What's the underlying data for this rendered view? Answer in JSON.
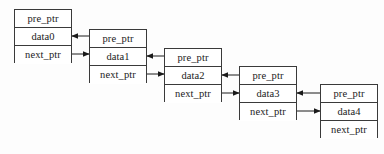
{
  "diagram": {
    "type": "doubly-linked-list",
    "background_color": "#fdfdfd",
    "border_color": "#3a3a3a",
    "text_color": "#1a1a1a",
    "node_width": 58,
    "node_height": 54,
    "cell_height": 18,
    "nodes": [
      {
        "id": "node0",
        "x": 14,
        "y": 9,
        "pre_ptr": "pre_ptr",
        "data": "data0",
        "next_ptr": "next_ptr"
      },
      {
        "id": "node1",
        "x": 89,
        "y": 29,
        "pre_ptr": "pre_ptr",
        "data": "data1",
        "next_ptr": "next_ptr"
      },
      {
        "id": "node2",
        "x": 164,
        "y": 48,
        "pre_ptr": "pre_ptr",
        "data": "data2",
        "next_ptr": "next_ptr"
      },
      {
        "id": "node3",
        "x": 239,
        "y": 66,
        "pre_ptr": "pre_ptr",
        "data": "data3",
        "next_ptr": "next_ptr"
      },
      {
        "id": "node4",
        "x": 320,
        "y": 84,
        "pre_ptr": "pre_ptr",
        "data": "data4",
        "next_ptr": "next_ptr"
      }
    ],
    "connections": [
      {
        "id": "next-0-1",
        "kind": "next-pointer",
        "direction": "right",
        "from_node": "node0",
        "from_row": "next_ptr",
        "to_node": "node1",
        "to_row": "pre_ptr",
        "x1": 72,
        "y1": 54,
        "x2": 89,
        "y2": 54
      },
      {
        "id": "prev-1-0",
        "kind": "prev-pointer",
        "direction": "left",
        "from_node": "node1",
        "from_row": "pre_ptr",
        "to_node": "node0",
        "to_row": "data0",
        "x1": 89,
        "y1": 36,
        "x2": 72,
        "y2": 36
      },
      {
        "id": "next-1-2",
        "kind": "next-pointer",
        "direction": "right",
        "from_node": "node1",
        "from_row": "next_ptr",
        "to_node": "node2",
        "to_row": "pre_ptr",
        "x1": 147,
        "y1": 74,
        "x2": 164,
        "y2": 74
      },
      {
        "id": "prev-2-1",
        "kind": "prev-pointer",
        "direction": "left",
        "from_node": "node2",
        "from_row": "pre_ptr",
        "to_node": "node1",
        "to_row": "data1",
        "x1": 164,
        "y1": 56,
        "x2": 147,
        "y2": 56
      },
      {
        "id": "next-2-3",
        "kind": "next-pointer",
        "direction": "right",
        "from_node": "node2",
        "from_row": "next_ptr",
        "to_node": "node3",
        "to_row": "pre_ptr",
        "x1": 222,
        "y1": 93,
        "x2": 239,
        "y2": 93
      },
      {
        "id": "prev-3-2",
        "kind": "prev-pointer",
        "direction": "left",
        "from_node": "node3",
        "from_row": "pre_ptr",
        "to_node": "node2",
        "to_row": "data2",
        "x1": 239,
        "y1": 75,
        "x2": 222,
        "y2": 75
      },
      {
        "id": "next-3-4",
        "kind": "next-pointer",
        "direction": "right",
        "from_node": "node3",
        "from_row": "next_ptr",
        "to_node": "node4",
        "to_row": "pre_ptr",
        "x1": 297,
        "y1": 111,
        "x2": 320,
        "y2": 111
      },
      {
        "id": "prev-4-3",
        "kind": "prev-pointer",
        "direction": "left",
        "from_node": "node4",
        "from_row": "pre_ptr",
        "to_node": "node3",
        "to_row": "data3",
        "x1": 320,
        "y1": 93,
        "x2": 297,
        "y2": 93
      }
    ]
  }
}
